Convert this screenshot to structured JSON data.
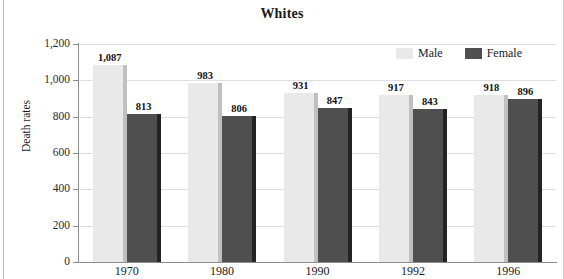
{
  "chart_data": {
    "type": "bar",
    "title": "Whites",
    "xlabel": "",
    "ylabel": "Death rates",
    "categories": [
      "1970",
      "1980",
      "1990",
      "1992",
      "1996"
    ],
    "series": [
      {
        "name": "Male",
        "color": "#e9e9e9",
        "values": [
          1087,
          983,
          931,
          917,
          918
        ],
        "labels": [
          "1,087",
          "983",
          "931",
          "917",
          "918"
        ]
      },
      {
        "name": "Female",
        "color": "#4f4f4f",
        "values": [
          813,
          806,
          847,
          843,
          896
        ],
        "labels": [
          "813",
          "806",
          "847",
          "843",
          "896"
        ]
      }
    ],
    "ylim": [
      0,
      1200
    ],
    "yticks": [
      0,
      200,
      400,
      600,
      800,
      1000,
      1200
    ],
    "ytick_labels": [
      "0",
      "200",
      "400",
      "600",
      "800",
      "1,000",
      "1,200"
    ],
    "grid": true,
    "legend_position": "top-right"
  },
  "legend": {
    "male_label": "Male",
    "female_label": "Female"
  }
}
